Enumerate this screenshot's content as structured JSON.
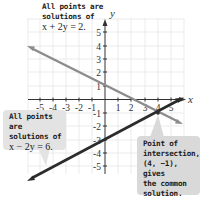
{
  "figure": {
    "x_axis_label": "x",
    "y_axis_label": "y",
    "x_ticks": [
      "-5",
      "-4",
      "-3",
      "-2",
      "-1",
      "1",
      "2",
      "3",
      "4",
      "5"
    ],
    "y_ticks": [
      "5",
      "4",
      "3",
      "2",
      "1",
      "-1",
      "-2",
      "-3",
      "-4",
      "-5"
    ],
    "lines": [
      {
        "name": "x + 2y = 2",
        "color": "#8c8c8c"
      },
      {
        "name": "x - 2y = 6",
        "color": "#2b2b2b"
      }
    ],
    "intersection_point": "(4, -1)"
  },
  "callouts": {
    "top": {
      "line1": "All points are",
      "line2": "solutions of",
      "equation": "x + 2y = 2."
    },
    "left": {
      "line1": "All points are",
      "line2": "solutions of",
      "equation": "x − 2y = 6."
    },
    "right": {
      "line1": "Point of",
      "line2": "intersection,",
      "line3": "(4, −1), gives",
      "line4": "the common",
      "line5": "solution."
    }
  }
}
